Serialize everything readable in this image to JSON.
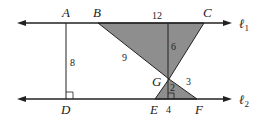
{
  "diagram": {
    "points": {
      "A": "A",
      "B": "B",
      "C": "C",
      "D": "D",
      "E": "E",
      "F": "F",
      "G": "G"
    },
    "lines": {
      "l1": "ℓ",
      "l1_sub": "1",
      "l2": "ℓ",
      "l2_sub": "2"
    },
    "lengths": {
      "BC": "12",
      "BG": "9",
      "height_upper": "6",
      "AD": "8",
      "height_lower": "2",
      "GF": "3",
      "EF": "4"
    },
    "colors": {
      "fill": "#8c8c8c",
      "stroke": "#222222"
    }
  }
}
